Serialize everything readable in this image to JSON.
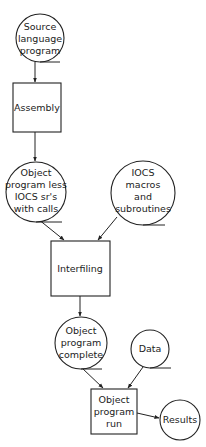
{
  "diagram": {
    "type": "flowchart",
    "nodes": [
      {
        "id": "source",
        "shape": "circle",
        "lines": [
          "Source",
          "language",
          "program"
        ],
        "cx": 40,
        "cy": 38,
        "r": 24
      },
      {
        "id": "assembly",
        "shape": "box",
        "lines": [
          "Assembly"
        ],
        "x": 13,
        "y": 83,
        "w": 48,
        "h": 49
      },
      {
        "id": "object_less",
        "shape": "circle",
        "lines": [
          "Object",
          "program less",
          "IOCS sr's",
          "with calls"
        ],
        "cx": 36,
        "cy": 192,
        "r": 30
      },
      {
        "id": "iocs",
        "shape": "circle",
        "lines": [
          "IOCS",
          "macros",
          "and",
          "subroutines"
        ],
        "cx": 143,
        "cy": 193,
        "r": 32
      },
      {
        "id": "interfiling",
        "shape": "box",
        "lines": [
          "Interfiling"
        ],
        "x": 51,
        "y": 241,
        "w": 59,
        "h": 55
      },
      {
        "id": "object_complete",
        "shape": "circle",
        "lines": [
          "Object",
          "program",
          "complete"
        ],
        "cx": 81,
        "cy": 343,
        "r": 26
      },
      {
        "id": "data",
        "shape": "circle",
        "lines": [
          "Data"
        ],
        "cx": 150,
        "cy": 349,
        "r": 19
      },
      {
        "id": "run",
        "shape": "box",
        "lines": [
          "Object",
          "program",
          "run"
        ],
        "x": 91,
        "y": 389,
        "w": 46,
        "h": 45
      },
      {
        "id": "results",
        "shape": "circle",
        "lines": [
          "Results"
        ],
        "cx": 180,
        "cy": 420,
        "r": 20
      }
    ],
    "edges": [
      {
        "from": "source",
        "to": "assembly"
      },
      {
        "from": "assembly",
        "to": "object_less"
      },
      {
        "from": "object_less",
        "to": "interfiling"
      },
      {
        "from": "iocs",
        "to": "interfiling"
      },
      {
        "from": "interfiling",
        "to": "object_complete"
      },
      {
        "from": "object_complete",
        "to": "run"
      },
      {
        "from": "data",
        "to": "run"
      },
      {
        "from": "run",
        "to": "results"
      }
    ]
  },
  "labels": {
    "source": [
      "Source",
      "language",
      "program"
    ],
    "assembly": "Assembly",
    "object_less": [
      "Object",
      "program less",
      "IOCS sr's",
      "with calls"
    ],
    "iocs": [
      "IOCS",
      "macros",
      "and",
      "subroutines"
    ],
    "interfiling": "Interfiling",
    "object_complete": [
      "Object",
      "program",
      "complete"
    ],
    "data": "Data",
    "run": [
      "Object",
      "program",
      "run"
    ],
    "results": "Results"
  }
}
